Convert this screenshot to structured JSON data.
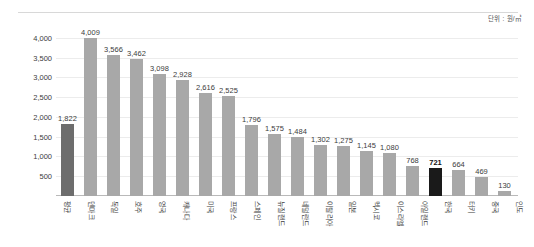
{
  "unit_caption": "단위 : 원/㎥",
  "chart_data": {
    "type": "bar",
    "title": "",
    "subtitle": "",
    "xlabel": "",
    "ylabel": "",
    "unit": "원/㎥",
    "ylim": [
      0,
      4300
    ],
    "yticks": [
      "4,000",
      "3,500",
      "3,000",
      "2,500",
      "2,000",
      "1,500",
      "1,000",
      "500"
    ],
    "ytick_values": [
      4000,
      3500,
      3000,
      2500,
      2000,
      1500,
      1000,
      500
    ],
    "grid": true,
    "legend": "none",
    "categories": [
      "평균",
      "덴마크",
      "독일",
      "호주",
      "영국",
      "캐나다",
      "미국",
      "프랑스",
      "스페인",
      "뉴질랜드",
      "네덜란드",
      "이탈리아",
      "일본",
      "멕시코",
      "이스라엘",
      "아일랜드",
      "한국",
      "터키",
      "중국",
      "인도"
    ],
    "values": [
      1822,
      4009,
      3566,
      3462,
      3098,
      2928,
      2616,
      2525,
      1796,
      1575,
      1484,
      1302,
      1275,
      1145,
      1080,
      768,
      721,
      664,
      469,
      130
    ],
    "value_labels": [
      "1,822",
      "4,009",
      "3,566",
      "3,462",
      "3,098",
      "2,928",
      "2,616",
      "2,525",
      "1,796",
      "1,575",
      "1,484",
      "1,302",
      "1,275",
      "1,145",
      "1,080",
      "768",
      "721",
      "664",
      "469",
      "130"
    ],
    "bar_styles": [
      "accent-dark",
      "normal",
      "normal",
      "normal",
      "normal",
      "normal",
      "normal",
      "normal",
      "normal",
      "normal",
      "normal",
      "normal",
      "normal",
      "normal",
      "normal",
      "normal",
      "accent-black",
      "normal",
      "normal",
      "normal"
    ],
    "emphasized_labels": [
      false,
      false,
      false,
      false,
      false,
      false,
      false,
      false,
      false,
      false,
      false,
      false,
      false,
      false,
      false,
      false,
      true,
      false,
      false,
      false
    ],
    "colors": {
      "bar_default": "#a8a8a8",
      "bar_average": "#6d6d6d",
      "bar_highlight": "#1a1a1a",
      "gridline": "#ececec",
      "axis": "#b9b9b9",
      "text": "#3c3c3c"
    }
  }
}
